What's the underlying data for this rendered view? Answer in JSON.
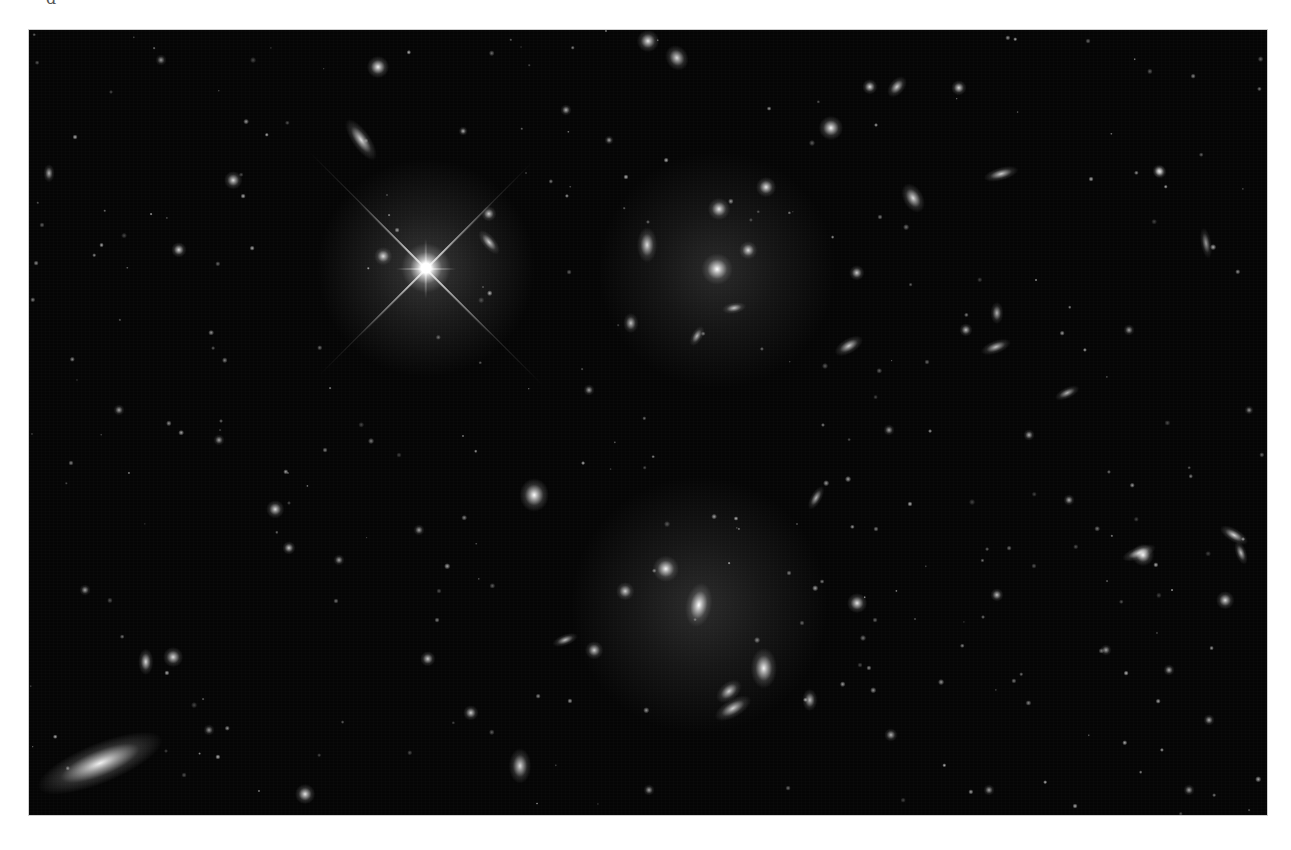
{
  "image": {
    "description": "Deep-field astronomical photograph of a galaxy cluster: a bright foreground star with diffraction spikes, two giant elliptical galaxies with diffuse halos, and hundreds of smaller galaxies and point sources on a black sky",
    "top_glyph": "ɑ",
    "frame": {
      "x": 29,
      "y": 30,
      "width": 1238,
      "height": 785,
      "background": "#050505",
      "page_background": "#ffffff"
    }
  },
  "halos": [
    {
      "name": "star-halo",
      "x": 397,
      "y": 238,
      "r": 110,
      "alpha": 0.22
    },
    {
      "name": "upper-cluster-halo",
      "x": 688,
      "y": 240,
      "r": 120,
      "alpha": 0.16
    },
    {
      "name": "lower-cluster-halo",
      "x": 670,
      "y": 575,
      "r": 130,
      "alpha": 0.17
    }
  ],
  "bright_star": {
    "x": 397,
    "y": 238,
    "core": 10,
    "spikes": [
      {
        "angle": 45,
        "len": 190
      },
      {
        "angle": -45,
        "len": 190
      },
      {
        "angle": 0,
        "len": 60
      },
      {
        "angle": 90,
        "len": 60
      }
    ],
    "thin_spikes": [
      {
        "angle": 45,
        "len": 330
      },
      {
        "angle": -45,
        "len": 300
      }
    ]
  },
  "sources": [
    {
      "x": 688,
      "y": 239,
      "w": 14,
      "h": 14,
      "b": 1.0,
      "rot": 0
    },
    {
      "x": 670,
      "y": 575,
      "w": 12,
      "h": 20,
      "b": 1.0,
      "rot": 10
    },
    {
      "x": 637,
      "y": 539,
      "w": 12,
      "h": 12,
      "b": 0.95,
      "rot": 0
    },
    {
      "x": 735,
      "y": 638,
      "w": 12,
      "h": 18,
      "b": 0.95,
      "rot": 0
    },
    {
      "x": 704,
      "y": 678,
      "w": 8,
      "h": 18,
      "b": 0.8,
      "rot": 60
    },
    {
      "x": 505,
      "y": 465,
      "w": 13,
      "h": 15,
      "b": 1.0,
      "rot": 0
    },
    {
      "x": 349,
      "y": 37,
      "w": 10,
      "h": 10,
      "b": 0.95,
      "rot": 0
    },
    {
      "x": 332,
      "y": 110,
      "w": 8,
      "h": 22,
      "b": 0.85,
      "rot": -35
    },
    {
      "x": 619,
      "y": 11,
      "w": 10,
      "h": 10,
      "b": 0.9,
      "rot": 0
    },
    {
      "x": 648,
      "y": 28,
      "w": 10,
      "h": 12,
      "b": 0.85,
      "rot": -30
    },
    {
      "x": 690,
      "y": 179,
      "w": 10,
      "h": 10,
      "b": 0.9,
      "rot": 0
    },
    {
      "x": 618,
      "y": 215,
      "w": 9,
      "h": 16,
      "b": 0.85,
      "rot": 0
    },
    {
      "x": 719,
      "y": 220,
      "w": 8,
      "h": 8,
      "b": 0.85,
      "rot": 0
    },
    {
      "x": 737,
      "y": 157,
      "w": 9,
      "h": 9,
      "b": 0.9,
      "rot": 0
    },
    {
      "x": 705,
      "y": 278,
      "w": 5,
      "h": 11,
      "b": 0.75,
      "rot": 80
    },
    {
      "x": 668,
      "y": 306,
      "w": 5,
      "h": 10,
      "b": 0.7,
      "rot": 30
    },
    {
      "x": 602,
      "y": 293,
      "w": 7,
      "h": 9,
      "b": 0.75,
      "rot": 0
    },
    {
      "x": 802,
      "y": 98,
      "w": 11,
      "h": 11,
      "b": 0.95,
      "rot": 0
    },
    {
      "x": 841,
      "y": 57,
      "w": 7,
      "h": 7,
      "b": 0.85,
      "rot": 0
    },
    {
      "x": 868,
      "y": 57,
      "w": 7,
      "h": 11,
      "b": 0.8,
      "rot": 40
    },
    {
      "x": 884,
      "y": 168,
      "w": 9,
      "h": 14,
      "b": 0.85,
      "rot": -30
    },
    {
      "x": 972,
      "y": 144,
      "w": 6,
      "h": 16,
      "b": 0.8,
      "rot": 75
    },
    {
      "x": 930,
      "y": 58,
      "w": 7,
      "h": 7,
      "b": 0.85,
      "rot": 0
    },
    {
      "x": 1131,
      "y": 142,
      "w": 6,
      "h": 6,
      "b": 0.8,
      "rot": 0
    },
    {
      "x": 1177,
      "y": 213,
      "w": 5,
      "h": 14,
      "b": 0.6,
      "rot": -10
    },
    {
      "x": 820,
      "y": 316,
      "w": 7,
      "h": 14,
      "b": 0.8,
      "rot": 60
    },
    {
      "x": 828,
      "y": 243,
      "w": 7,
      "h": 7,
      "b": 0.8,
      "rot": 0
    },
    {
      "x": 967,
      "y": 317,
      "w": 6,
      "h": 14,
      "b": 0.75,
      "rot": 70
    },
    {
      "x": 968,
      "y": 283,
      "w": 6,
      "h": 10,
      "b": 0.7,
      "rot": 0
    },
    {
      "x": 937,
      "y": 300,
      "w": 6,
      "h": 6,
      "b": 0.75,
      "rot": 0
    },
    {
      "x": 1038,
      "y": 363,
      "w": 5,
      "h": 12,
      "b": 0.7,
      "rot": 65
    },
    {
      "x": 1110,
      "y": 523,
      "w": 6,
      "h": 16,
      "b": 0.85,
      "rot": 70
    },
    {
      "x": 1114,
      "y": 525,
      "w": 10,
      "h": 10,
      "b": 0.95,
      "rot": 0
    },
    {
      "x": 1205,
      "y": 505,
      "w": 6,
      "h": 14,
      "b": 0.85,
      "rot": -60
    },
    {
      "x": 1212,
      "y": 523,
      "w": 5,
      "h": 11,
      "b": 0.75,
      "rot": -20
    },
    {
      "x": 1196,
      "y": 570,
      "w": 8,
      "h": 8,
      "b": 0.85,
      "rot": 0
    },
    {
      "x": 1130,
      "y": 141,
      "w": 6,
      "h": 6,
      "b": 0.7,
      "rot": 0
    },
    {
      "x": 71,
      "y": 733,
      "w": 18,
      "h": 60,
      "b": 0.95,
      "rot": 68
    },
    {
      "x": 117,
      "y": 632,
      "w": 7,
      "h": 12,
      "b": 0.85,
      "rot": 0
    },
    {
      "x": 144,
      "y": 627,
      "w": 9,
      "h": 9,
      "b": 0.85,
      "rot": 0
    },
    {
      "x": 276,
      "y": 764,
      "w": 9,
      "h": 9,
      "b": 0.9,
      "rot": 0
    },
    {
      "x": 246,
      "y": 479,
      "w": 8,
      "h": 8,
      "b": 0.85,
      "rot": 0
    },
    {
      "x": 260,
      "y": 518,
      "w": 6,
      "h": 6,
      "b": 0.8,
      "rot": 0
    },
    {
      "x": 150,
      "y": 220,
      "w": 7,
      "h": 7,
      "b": 0.85,
      "rot": 0
    },
    {
      "x": 204,
      "y": 150,
      "w": 8,
      "h": 8,
      "b": 0.85,
      "rot": 0
    },
    {
      "x": 20,
      "y": 143,
      "w": 5,
      "h": 8,
      "b": 0.7,
      "rot": 0
    },
    {
      "x": 132,
      "y": 30,
      "w": 5,
      "h": 5,
      "b": 0.6,
      "rot": 0
    },
    {
      "x": 491,
      "y": 736,
      "w": 10,
      "h": 16,
      "b": 0.85,
      "rot": 0
    },
    {
      "x": 565,
      "y": 620,
      "w": 8,
      "h": 8,
      "b": 0.8,
      "rot": 0
    },
    {
      "x": 536,
      "y": 610,
      "w": 5,
      "h": 12,
      "b": 0.75,
      "rot": 70
    },
    {
      "x": 442,
      "y": 683,
      "w": 7,
      "h": 7,
      "b": 0.8,
      "rot": 0
    },
    {
      "x": 399,
      "y": 629,
      "w": 7,
      "h": 7,
      "b": 0.8,
      "rot": 0
    },
    {
      "x": 596,
      "y": 561,
      "w": 8,
      "h": 8,
      "b": 0.8,
      "rot": 0
    },
    {
      "x": 787,
      "y": 468,
      "w": 5,
      "h": 12,
      "b": 0.7,
      "rot": 30
    },
    {
      "x": 828,
      "y": 573,
      "w": 9,
      "h": 9,
      "b": 0.9,
      "rot": 0
    },
    {
      "x": 968,
      "y": 565,
      "w": 6,
      "h": 6,
      "b": 0.75,
      "rot": 0
    },
    {
      "x": 781,
      "y": 670,
      "w": 7,
      "h": 10,
      "b": 0.75,
      "rot": 0
    },
    {
      "x": 862,
      "y": 705,
      "w": 6,
      "h": 6,
      "b": 0.7,
      "rot": 0
    },
    {
      "x": 700,
      "y": 661,
      "w": 8,
      "h": 13,
      "b": 0.8,
      "rot": 50
    },
    {
      "x": 460,
      "y": 212,
      "w": 6,
      "h": 13,
      "b": 0.8,
      "rot": -40
    },
    {
      "x": 460,
      "y": 184,
      "w": 7,
      "h": 7,
      "b": 0.8,
      "rot": 0
    },
    {
      "x": 354,
      "y": 226,
      "w": 8,
      "h": 8,
      "b": 0.85,
      "rot": 0
    },
    {
      "x": 434,
      "y": 101,
      "w": 4,
      "h": 4,
      "b": 0.7,
      "rot": 0
    },
    {
      "x": 537,
      "y": 80,
      "w": 5,
      "h": 5,
      "b": 0.7,
      "rot": 0
    },
    {
      "x": 580,
      "y": 110,
      "w": 4,
      "h": 4,
      "b": 0.65,
      "rot": 0
    },
    {
      "x": 1180,
      "y": 690,
      "w": 5,
      "h": 5,
      "b": 0.7,
      "rot": 0
    },
    {
      "x": 1140,
      "y": 640,
      "w": 5,
      "h": 5,
      "b": 0.7,
      "rot": 0
    },
    {
      "x": 1040,
      "y": 470,
      "w": 5,
      "h": 5,
      "b": 0.7,
      "rot": 0
    },
    {
      "x": 1000,
      "y": 405,
      "w": 5,
      "h": 5,
      "b": 0.7,
      "rot": 0
    },
    {
      "x": 1077,
      "y": 620,
      "w": 5,
      "h": 5,
      "b": 0.65,
      "rot": 0
    },
    {
      "x": 56,
      "y": 560,
      "w": 5,
      "h": 5,
      "b": 0.65,
      "rot": 0
    },
    {
      "x": 90,
      "y": 380,
      "w": 5,
      "h": 5,
      "b": 0.65,
      "rot": 0
    },
    {
      "x": 190,
      "y": 410,
      "w": 5,
      "h": 5,
      "b": 0.65,
      "rot": 0
    },
    {
      "x": 310,
      "y": 530,
      "w": 5,
      "h": 5,
      "b": 0.65,
      "rot": 0
    },
    {
      "x": 390,
      "y": 500,
      "w": 5,
      "h": 5,
      "b": 0.65,
      "rot": 0
    },
    {
      "x": 560,
      "y": 360,
      "w": 5,
      "h": 5,
      "b": 0.65,
      "rot": 0
    },
    {
      "x": 860,
      "y": 400,
      "w": 5,
      "h": 5,
      "b": 0.65,
      "rot": 0
    },
    {
      "x": 1100,
      "y": 300,
      "w": 5,
      "h": 5,
      "b": 0.65,
      "rot": 0
    },
    {
      "x": 1220,
      "y": 380,
      "w": 4,
      "h": 4,
      "b": 0.6,
      "rot": 0
    },
    {
      "x": 1160,
      "y": 760,
      "w": 5,
      "h": 5,
      "b": 0.65,
      "rot": 0
    },
    {
      "x": 960,
      "y": 760,
      "w": 5,
      "h": 5,
      "b": 0.65,
      "rot": 0
    },
    {
      "x": 620,
      "y": 760,
      "w": 5,
      "h": 5,
      "b": 0.65,
      "rot": 0
    },
    {
      "x": 180,
      "y": 700,
      "w": 5,
      "h": 5,
      "b": 0.6,
      "rot": 0
    }
  ],
  "faint_count": 260,
  "faint_seed": 7
}
